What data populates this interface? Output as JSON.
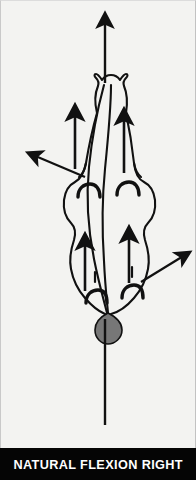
{
  "figure": {
    "caption": "NATURAL FLEXION RIGHT",
    "background_color": "#f3f3f1",
    "caption_background_color": "#050505",
    "caption_text_color": "#ffffff",
    "outline_color": "#111111",
    "disc_color": "#777777"
  },
  "diagram": {
    "type": "anatomical-line-drawing",
    "elements": {
      "vertical_reference_line_top_label": "central vertical reference arrow pointing up",
      "vertical_reference_line_bottom_label": "central vertical reference line below",
      "disc_label": "intervertebral disc marker",
      "spinous_process_label": "curved spinous process line",
      "facet_marks_count": 4,
      "internal_arrows_count": 4,
      "external_arrows_count": 2
    },
    "arrows": [
      {
        "name": "top-vertical-arrow",
        "direction": "up",
        "x1": 104,
        "y1": 82,
        "x2": 104,
        "y2": 14
      },
      {
        "name": "inner-arrow-upper-left",
        "direction": "up",
        "x1": 74,
        "y1": 168,
        "x2": 74,
        "y2": 106
      },
      {
        "name": "inner-arrow-upper-right",
        "direction": "up",
        "x1": 123,
        "y1": 172,
        "x2": 123,
        "y2": 110
      },
      {
        "name": "inner-arrow-lower-left",
        "direction": "up",
        "x1": 84,
        "y1": 290,
        "x2": 84,
        "y2": 235
      },
      {
        "name": "inner-arrow-lower-right",
        "direction": "up",
        "x1": 128,
        "y1": 282,
        "x2": 128,
        "y2": 228
      },
      {
        "name": "external-arrow-left",
        "direction": "upper-left",
        "x1": 82,
        "y1": 175,
        "x2": 28,
        "y2": 152
      },
      {
        "name": "external-arrow-right",
        "direction": "upper-right",
        "x1": 140,
        "y1": 280,
        "x2": 186,
        "y2": 253
      }
    ]
  }
}
